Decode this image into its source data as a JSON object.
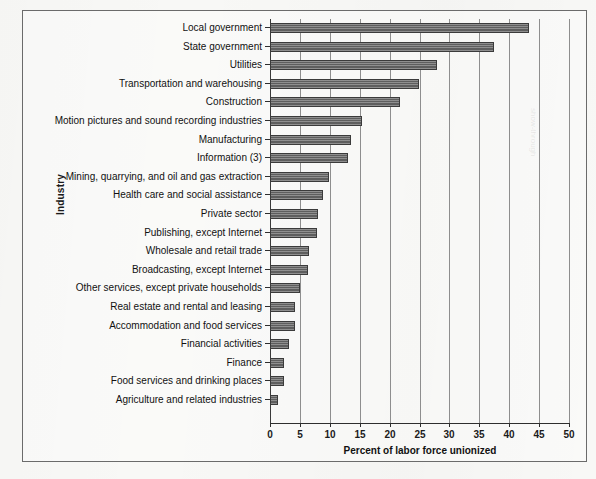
{
  "chart_data": {
    "type": "bar",
    "orientation": "horizontal",
    "title": "",
    "xlabel": "Percent of labor force unionized",
    "ylabel": "Industry",
    "xlim": [
      0,
      50
    ],
    "xticks": [
      0,
      5,
      10,
      15,
      20,
      25,
      30,
      35,
      40,
      45,
      50
    ],
    "grid": true,
    "legend": null,
    "bar_color": "#5e5e5e",
    "bar_edge_color": "#3b3b3b",
    "categories": [
      "Local government",
      "State government",
      "Utilities",
      "Transportation and warehousing",
      "Construction",
      "Motion pictures and sound recording industries",
      "Manufacturing",
      "Information (3)",
      "Mining, quarrying, and oil and gas extraction",
      "Health care and social assistance",
      "Private sector",
      "Publishing, except Internet",
      "Wholesale and retail trade",
      "Broadcasting, except Internet",
      "Other services, except private households",
      "Real estate and rental and leasing",
      "Accommodation and food services",
      "Financial activities",
      "Finance",
      "Food services and drinking places",
      "Agriculture and related industries"
    ],
    "values": [
      43.3,
      37.5,
      28.0,
      24.9,
      21.7,
      15.4,
      13.5,
      13.1,
      9.9,
      8.9,
      8.0,
      7.8,
      6.5,
      6.3,
      5.0,
      4.2,
      4.1,
      3.2,
      2.4,
      2.3,
      1.4
    ]
  },
  "axis": {
    "ylabel": "Industry",
    "xlabel": "Percent of labor force unionized"
  }
}
